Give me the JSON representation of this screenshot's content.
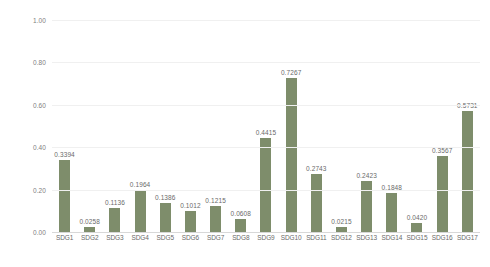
{
  "chart_data": {
    "type": "bar",
    "title": "",
    "subtitle": "",
    "xlabel": "",
    "ylabel": "",
    "ylim": [
      0.0,
      1.0
    ],
    "ytick_step": 0.2,
    "ytick_labels": [
      "0.00",
      "0.20",
      "0.40",
      "0.60",
      "0.80",
      "1.00"
    ],
    "ytick_values": [
      0.0,
      0.2,
      0.4,
      0.6,
      0.8,
      1.0
    ],
    "grid": true,
    "legend": false,
    "legend_position": "none",
    "bar_color": "#7e8d6b",
    "label_format": "0.0000",
    "categories": [
      "SDG1",
      "SDG2",
      "SDG3",
      "SDG4",
      "SDG5",
      "SDG6",
      "SDG7",
      "SDG8",
      "SDG9",
      "SDG10",
      "SDG11",
      "SDG12",
      "SDG13",
      "SDG14",
      "SDG15",
      "SDG16",
      "SDG17"
    ],
    "values": [
      0.3394,
      0.0258,
      0.1136,
      0.1964,
      0.1386,
      0.1012,
      0.1215,
      0.0608,
      0.4415,
      0.7267,
      0.2743,
      0.0215,
      0.2423,
      0.1848,
      0.042,
      0.3567,
      0.5731
    ],
    "value_labels": [
      "0.3394",
      "0.0258",
      "0.1136",
      "0.1964",
      "0.1386",
      "0.1012",
      "0.1215",
      "0.0608",
      "0.4415",
      "0.7267",
      "0.2743",
      "0.0215",
      "0.2423",
      "0.1848",
      "0.0420",
      "0.3567",
      "0.5731"
    ]
  }
}
